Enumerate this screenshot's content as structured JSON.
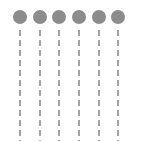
{
  "canvas": {
    "width": 146,
    "height": 141,
    "background_color": "#ffffff"
  },
  "diagram": {
    "type": "node-column-diagram",
    "node_count": 6,
    "node_shape": "circle",
    "node_fill_color": "#8c8c8c",
    "node_radius": 7,
    "node_diameter": 14,
    "node_center_y": 17,
    "line_color": "#8c8c8c",
    "line_width": 1.6,
    "line_style": "dashed",
    "dash_length": 6,
    "dash_gap": 4,
    "line_start_y": 30,
    "line_end_y": 141,
    "columns": [
      {
        "id": "column-1",
        "label": "1",
        "center_x": 20
      },
      {
        "id": "column-2",
        "label": "2",
        "center_x": 40
      },
      {
        "id": "column-3",
        "label": "3",
        "center_x": 59
      },
      {
        "id": "column-4",
        "label": "4",
        "center_x": 79
      },
      {
        "id": "column-5",
        "label": "5",
        "center_x": 99
      },
      {
        "id": "column-6",
        "label": "6",
        "center_x": 118
      }
    ]
  }
}
